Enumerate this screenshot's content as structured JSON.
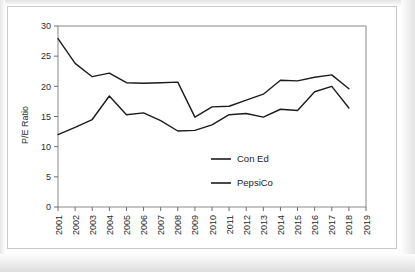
{
  "chart_data": {
    "type": "line",
    "title": "",
    "xlabel": "",
    "ylabel": "P/E Ratio",
    "x": [
      2001,
      2002,
      2003,
      2004,
      2005,
      2006,
      2007,
      2008,
      2009,
      2010,
      2011,
      2012,
      2013,
      2014,
      2015,
      2016,
      2017,
      2018
    ],
    "categories": [
      "2001",
      "2002",
      "2003",
      "2004",
      "2005",
      "2006",
      "2007",
      "2008",
      "2009",
      "2010",
      "2011",
      "2012",
      "2013",
      "2014",
      "2015",
      "2016",
      "2017",
      "2018"
    ],
    "xticklabels": [
      "2001",
      "2002",
      "2003",
      "2004",
      "2005",
      "2006",
      "2007",
      "2008",
      "2009",
      "2010",
      "2011",
      "2012",
      "2013",
      "2014",
      "2015",
      "2016",
      "2017",
      "2018",
      "2019"
    ],
    "yticklabels": [
      "0",
      "5",
      "10",
      "15",
      "20",
      "25",
      "30"
    ],
    "yticks": [
      0,
      5,
      10,
      15,
      20,
      25,
      30
    ],
    "ylim": [
      0,
      30
    ],
    "xlim": [
      2001,
      2019
    ],
    "grid": false,
    "legend_position": "center",
    "series": [
      {
        "name": "Con Ed",
        "color": "#1c1c1c",
        "values": [
          27.9,
          23.8,
          21.6,
          22.2,
          20.6,
          20.5,
          20.6,
          20.7,
          14.9,
          16.6,
          16.7,
          17.7,
          18.7,
          21.0,
          20.9,
          21.5,
          21.9,
          19.6
        ]
      },
      {
        "name": "PepsiCo",
        "color": "#1c1c1c",
        "values": [
          12.0,
          13.2,
          14.5,
          18.4,
          15.3,
          15.6,
          14.3,
          12.6,
          12.7,
          13.6,
          15.3,
          15.5,
          14.9,
          16.2,
          16.0,
          19.1,
          20.0,
          16.4
        ]
      }
    ]
  },
  "legend": {
    "items": [
      {
        "label": "Con Ed"
      },
      {
        "label": "PepsiCo"
      }
    ]
  }
}
